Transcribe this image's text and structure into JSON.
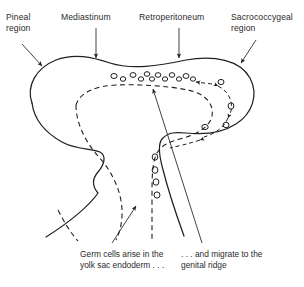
{
  "figure": {
    "ink_color": "#231f20",
    "background": "#ffffff",
    "labels": {
      "pineal": "Pineal\nregion",
      "mediastinum": "Mediastinum",
      "retroperitoneum": "Retroperitoneum",
      "sacrococcygeal": "Sacrococcygeal\nregion"
    },
    "captions": {
      "left": "Germ cells arise in the\nyolk sac endoderm . . .",
      "right": ". . . and migrate to the\ngenital ridge"
    },
    "icons": {
      "pointer_arrow": "arrow-pointer-icon",
      "migration_arrow": "migration-direction-arrow-icon",
      "germ_cell": "germ-cell-oval-icon"
    },
    "counts": {
      "germ_cells_horizontal_row": 12,
      "germ_cells_vertical_column": 4,
      "germ_cells_right_loop": 3,
      "label_leader_lines": 4,
      "caption_leader_lines": 2
    }
  }
}
